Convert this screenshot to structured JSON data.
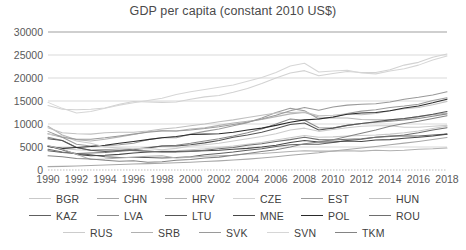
{
  "chart_data": {
    "type": "line",
    "title": "GDP per capita (constant 2010 US$)",
    "xlabel": "",
    "ylabel": "",
    "xlim": [
      1990,
      2018
    ],
    "ylim": [
      0,
      30000
    ],
    "ytick_values": [
      0,
      5000,
      10000,
      15000,
      20000,
      25000,
      30000
    ],
    "ytick_labels": [
      "0",
      "5000",
      "10000",
      "15000",
      "20000",
      "25000",
      "30000"
    ],
    "xtick_values": [
      1990,
      1992,
      1994,
      1996,
      1998,
      2000,
      2002,
      2004,
      2006,
      2008,
      2010,
      2012,
      2014,
      2016,
      2018
    ],
    "xtick_labels": [
      "1990",
      "1992",
      "1994",
      "1996",
      "1998",
      "2000",
      "2002",
      "2004",
      "2006",
      "2008",
      "2010",
      "2012",
      "2014",
      "2016",
      "2018"
    ],
    "x": [
      1990,
      1991,
      1992,
      1993,
      1994,
      1995,
      1996,
      1997,
      1998,
      1999,
      2000,
      2001,
      2002,
      2003,
      2004,
      2005,
      2006,
      2007,
      2008,
      2009,
      2010,
      2011,
      2012,
      2013,
      2014,
      2015,
      2016,
      2017,
      2018
    ],
    "grid": true,
    "legend_position": "bottom",
    "series": [
      {
        "name": "BGR",
        "color": "#c9c9c9",
        "values": [
          5200,
          4700,
          4400,
          4300,
          4400,
          4600,
          4200,
          3900,
          4100,
          4200,
          4400,
          4600,
          4900,
          5200,
          5600,
          6000,
          6500,
          7000,
          7500,
          7100,
          7200,
          7400,
          7500,
          7600,
          7800,
          8100,
          8500,
          9000,
          9500
        ]
      },
      {
        "name": "CHN",
        "color": "#a8a8a8",
        "values": [
          730,
          790,
          880,
          980,
          1080,
          1180,
          1290,
          1390,
          1480,
          1580,
          1700,
          1830,
          1980,
          2160,
          2360,
          2590,
          2870,
          3200,
          3480,
          3760,
          4110,
          4460,
          4790,
          5130,
          5490,
          5840,
          6210,
          6620,
          7050
        ]
      },
      {
        "name": "HRV",
        "color": "#b5b5b5",
        "values": [
          9500,
          7600,
          6600,
          6300,
          6700,
          7200,
          7700,
          8300,
          8600,
          8500,
          8900,
          9200,
          9700,
          10200,
          10600,
          11000,
          11600,
          12200,
          12500,
          11500,
          11300,
          11300,
          11000,
          10900,
          10900,
          11200,
          11600,
          12000,
          12400
        ]
      },
      {
        "name": "CZE",
        "color": "#d2d2d2",
        "values": [
          14000,
          13200,
          13100,
          13200,
          13500,
          14300,
          14900,
          14800,
          14700,
          14800,
          15400,
          15900,
          16200,
          16900,
          17700,
          18800,
          20000,
          21100,
          21600,
          20500,
          21000,
          21400,
          21200,
          21200,
          21800,
          22800,
          23400,
          24500,
          25200
        ]
      },
      {
        "name": "EST",
        "color": "#9c9c9c",
        "values": [
          7900,
          7100,
          5600,
          5200,
          5300,
          5500,
          5800,
          6600,
          7000,
          7000,
          7800,
          8400,
          8900,
          9600,
          10300,
          11300,
          12500,
          13400,
          12900,
          11100,
          11400,
          12300,
          12800,
          13100,
          13600,
          13900,
          14300,
          15100,
          15700
        ]
      },
      {
        "name": "HUN",
        "color": "#c0c0c0",
        "values": [
          9200,
          8100,
          7900,
          7800,
          8100,
          8200,
          8200,
          8500,
          8900,
          9200,
          9600,
          10000,
          10500,
          10900,
          11400,
          11900,
          12400,
          12500,
          12600,
          11800,
          11900,
          12200,
          12000,
          12300,
          12900,
          13300,
          13600,
          14200,
          14900
        ]
      },
      {
        "name": "KAZ",
        "color": "#606060",
        "values": [
          4200,
          3800,
          3600,
          3300,
          2900,
          2700,
          2700,
          2700,
          2600,
          2700,
          2900,
          3300,
          3600,
          3900,
          4300,
          4600,
          5100,
          5500,
          5600,
          5600,
          6000,
          6400,
          6700,
          7100,
          7400,
          7400,
          7400,
          7600,
          7800
        ]
      },
      {
        "name": "LVA",
        "color": "#8a8a8a",
        "values": [
          7100,
          6400,
          4900,
          4300,
          4400,
          4300,
          4500,
          4900,
          5200,
          5400,
          5800,
          6300,
          6800,
          7400,
          8100,
          8900,
          10000,
          11100,
          10800,
          9200,
          9100,
          9700,
          10100,
          10400,
          10600,
          10900,
          11200,
          11700,
          12200
        ]
      },
      {
        "name": "LTU",
        "color": "#555555",
        "values": [
          6800,
          6400,
          4900,
          4300,
          4000,
          4200,
          4400,
          4800,
          5200,
          5200,
          5500,
          5900,
          6400,
          7100,
          7600,
          8200,
          9000,
          9900,
          10200,
          8700,
          9100,
          9700,
          10100,
          10500,
          10900,
          11200,
          11600,
          12100,
          12700
        ]
      },
      {
        "name": "MNE",
        "color": "#474747",
        "values": [
          5200,
          4400,
          3400,
          3100,
          3200,
          3400,
          3700,
          3900,
          4000,
          4000,
          4100,
          4200,
          4300,
          4500,
          4700,
          5000,
          5400,
          6000,
          6400,
          6100,
          6100,
          6300,
          6200,
          6500,
          6600,
          6900,
          7100,
          7400,
          7800
        ]
      },
      {
        "name": "POL",
        "color": "#2a2a2a",
        "values": [
          5100,
          4700,
          4900,
          5100,
          5400,
          5800,
          6200,
          6600,
          7000,
          7300,
          7700,
          7800,
          7900,
          8200,
          8700,
          9100,
          9700,
          10400,
          10900,
          11100,
          11500,
          12100,
          12400,
          12500,
          12900,
          13500,
          13900,
          14600,
          15400
        ]
      },
      {
        "name": "ROU",
        "color": "#6e6e6e",
        "values": [
          4500,
          3900,
          3600,
          3700,
          3800,
          4100,
          4300,
          4100,
          3900,
          3900,
          4000,
          4300,
          4600,
          4900,
          5400,
          5700,
          6200,
          6600,
          7100,
          6600,
          6500,
          6700,
          6800,
          7100,
          7300,
          7600,
          8100,
          8700,
          9200
        ]
      },
      {
        "name": "RUS",
        "color": "#cccccc",
        "values": [
          7800,
          7400,
          6300,
          5800,
          5000,
          4800,
          4600,
          4700,
          4400,
          4700,
          5200,
          5500,
          5800,
          6300,
          6800,
          7300,
          7900,
          8700,
          9100,
          8400,
          8800,
          9200,
          9500,
          9600,
          9600,
          9300,
          9300,
          9500,
          9700
        ]
      },
      {
        "name": "SRB",
        "color": "#b0b0b0",
        "values": [
          5300,
          4500,
          3400,
          2300,
          2400,
          2600,
          2800,
          3000,
          3100,
          2600,
          2800,
          3000,
          3100,
          3200,
          3500,
          3600,
          3800,
          4000,
          4200,
          4100,
          4100,
          4200,
          4100,
          4300,
          4200,
          4300,
          4500,
          4600,
          4800
        ]
      },
      {
        "name": "SVK",
        "color": "#9a9a9a",
        "values": [
          8400,
          7100,
          6700,
          6700,
          7000,
          7400,
          7800,
          8200,
          8500,
          8500,
          8700,
          9000,
          9400,
          9900,
          10400,
          11100,
          11900,
          12900,
          13600,
          13000,
          13700,
          14100,
          14300,
          14400,
          14800,
          15400,
          15800,
          16300,
          17000
        ]
      },
      {
        "name": "SVN",
        "color": "#d6d6d6",
        "values": [
          14700,
          13400,
          12400,
          12700,
          13400,
          14100,
          14600,
          15100,
          15600,
          16400,
          17000,
          17500,
          18000,
          18500,
          19300,
          20100,
          21200,
          22600,
          23200,
          21300,
          21500,
          21700,
          21100,
          20900,
          21500,
          22000,
          22800,
          23900,
          24800
        ]
      },
      {
        "name": "TKM",
        "color": "#848484",
        "values": [
          3100,
          2900,
          2500,
          2400,
          2100,
          1900,
          2000,
          1700,
          1800,
          2100,
          2300,
          2600,
          2800,
          3200,
          3600,
          4000,
          4400,
          5000,
          5700,
          6100,
          6600,
          7300,
          8000,
          8700,
          9500,
          10100,
          10600,
          11200,
          11800
        ]
      }
    ]
  },
  "legend": {
    "rows": [
      [
        {
          "label": "BGR",
          "color": "#c9c9c9"
        },
        {
          "label": "CHN",
          "color": "#a8a8a8"
        },
        {
          "label": "HRV",
          "color": "#b5b5b5"
        },
        {
          "label": "CZE",
          "color": "#d2d2d2"
        },
        {
          "label": "EST",
          "color": "#9c9c9c"
        },
        {
          "label": "HUN",
          "color": "#c0c0c0"
        }
      ],
      [
        {
          "label": "KAZ",
          "color": "#606060"
        },
        {
          "label": "LVA",
          "color": "#8a8a8a"
        },
        {
          "label": "LTU",
          "color": "#555555"
        },
        {
          "label": "MNE",
          "color": "#474747"
        },
        {
          "label": "POL",
          "color": "#2a2a2a"
        },
        {
          "label": "ROU",
          "color": "#6e6e6e"
        }
      ],
      [
        {
          "label": "RUS",
          "color": "#cccccc"
        },
        {
          "label": "SRB",
          "color": "#b0b0b0"
        },
        {
          "label": "SVK",
          "color": "#9a9a9a"
        },
        {
          "label": "SVN",
          "color": "#d6d6d6"
        },
        {
          "label": "TKM",
          "color": "#848484"
        }
      ]
    ]
  }
}
